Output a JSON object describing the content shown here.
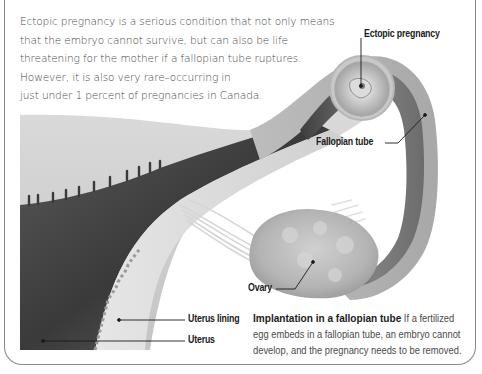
{
  "intro": {
    "lines": [
      "Ectopic pregnancy is a serious condition that not only means",
      "that the embryo cannot survive, but can also be life",
      "threatening for the mother if a fallopian tube ruptures.",
      "However, it is also very rare–occurring in",
      "just under 1 percent of pregnancies in Canada."
    ]
  },
  "labels": {
    "ectopic_pregnancy": "Ectopic pregnancy",
    "fallopian_tube": "Fallopian tube",
    "ovary": "Ovary",
    "uterus_lining": "Uterus lining",
    "uterus": "Uterus"
  },
  "caption": {
    "title": "Implantation in a fallopian tube",
    "line1_rest": " If a fertilized",
    "line2": "egg embeds in a fallopian tube, an embryo cannot",
    "line3": "develop, and the pregnancy needs to be removed."
  },
  "colors": {
    "frame": "#8a8a8a",
    "text": "#4a4a4a",
    "label": "#1a1a1a",
    "tissue_light": "#d4d4d4",
    "tissue_mid": "#b0b0b0",
    "tissue_dark": "#3c3c3c"
  }
}
